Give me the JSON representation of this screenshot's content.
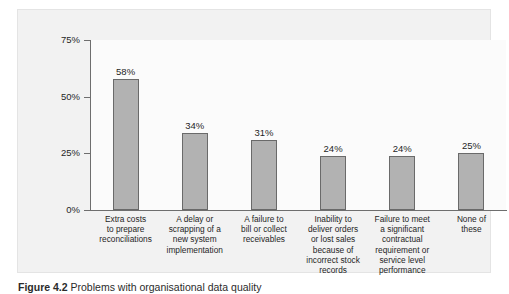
{
  "figure": {
    "caption_number": "Figure 4.2",
    "caption_text": "Problems with organisational data quality"
  },
  "colors": {
    "bar_fill": "#b2b2b2",
    "bar_border": "#6a6a6a",
    "axis": "#6e6e6e",
    "frame_background": "#f2f2f2",
    "plot_background": "#fbfbfb",
    "text": "#1f1f1f"
  },
  "chart_data": {
    "type": "bar",
    "title": "",
    "subtitle": "",
    "xlabel": "",
    "ylabel": "",
    "ylim": [
      0,
      75
    ],
    "yticks": [
      0,
      25,
      50,
      75
    ],
    "ytick_labels": [
      "0%",
      "25%",
      "50%",
      "75%"
    ],
    "grid": false,
    "legend": false,
    "orientation": "vertical",
    "value_labels": [
      "58%",
      "34%",
      "31%",
      "24%",
      "24%",
      "25%"
    ],
    "categories": [
      "Extra costs to prepare reconciliations",
      "A delay or scrapping of a new system implementation",
      "A failure to bill or collect receivables",
      "Inability to deliver orders or lost sales because of incorrect stock records",
      "Failure to meet a significant contractual requirement or service level performance",
      "None of these"
    ],
    "category_lines": [
      [
        "Extra costs",
        "to prepare",
        "reconciliations"
      ],
      [
        "A delay or",
        "scrapping of a",
        "new system",
        "implementation"
      ],
      [
        "A failure to",
        "bill or collect",
        "receivables"
      ],
      [
        "Inability to",
        "deliver orders",
        "or lost sales",
        "because of",
        "incorrect stock",
        "records"
      ],
      [
        "Failure to meet",
        "a significant",
        "contractual",
        "requirement or",
        "service level",
        "performance"
      ],
      [
        "None of",
        "these"
      ]
    ],
    "values": [
      58,
      34,
      31,
      24,
      24,
      25
    ]
  }
}
